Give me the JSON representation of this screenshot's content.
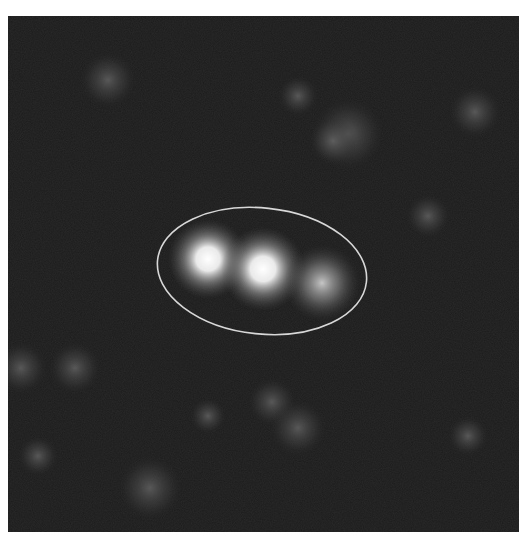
{
  "image": {
    "type": "grayscale fluorescence micrograph",
    "background_color": "#1c1c1c",
    "annotation": {
      "shape": "ellipse",
      "color": "#d8d8d8",
      "cx": 255,
      "cy": 255,
      "rx": 106,
      "ry": 64,
      "rotation_deg": 6
    },
    "bright_spots": [
      {
        "x": 200,
        "y": 243,
        "r": 40,
        "intensity": 1.0
      },
      {
        "x": 255,
        "y": 253,
        "r": 42,
        "intensity": 1.0
      },
      {
        "x": 314,
        "y": 267,
        "r": 38,
        "intensity": 0.6
      }
    ],
    "faint_blobs": [
      {
        "x": 100,
        "y": 64,
        "r": 28
      },
      {
        "x": 340,
        "y": 118,
        "r": 36
      },
      {
        "x": 467,
        "y": 96,
        "r": 26
      },
      {
        "x": 290,
        "y": 80,
        "r": 20
      },
      {
        "x": 13,
        "y": 352,
        "r": 26
      },
      {
        "x": 67,
        "y": 352,
        "r": 26
      },
      {
        "x": 264,
        "y": 386,
        "r": 24
      },
      {
        "x": 290,
        "y": 412,
        "r": 28
      },
      {
        "x": 142,
        "y": 472,
        "r": 32
      },
      {
        "x": 200,
        "y": 400,
        "r": 18
      },
      {
        "x": 460,
        "y": 420,
        "r": 20
      }
    ]
  }
}
